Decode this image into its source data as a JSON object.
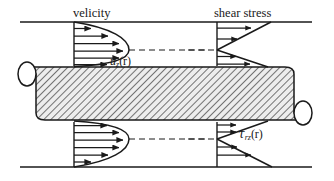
{
  "figure": {
    "type": "pipe-flow-profile-diagram",
    "title_labels": {
      "velocity": "velicity",
      "shear_stress": "shear stress"
    },
    "curve_labels": {
      "velocity_symbol": "u",
      "velocity_subscript": "z",
      "velocity_argument": "(r)",
      "shear_symbol": "τ",
      "shear_subscript": "rz",
      "shear_argument": "(r)"
    },
    "colors": {
      "line": "#1a1a1a",
      "hatch": "#555555",
      "pipe_fill": "#e8e8e8",
      "background": "#ffffff"
    },
    "geometry": {
      "top_wall_y": 22,
      "bottom_wall_y": 167,
      "pipe_top_y": 66,
      "pipe_bottom_y": 120,
      "velocity_axis_x": 74,
      "shear_axis_x": 217,
      "frame_left_x": 20,
      "frame_right_x": 312
    },
    "profiles": [
      {
        "name": "velocity-top",
        "kind": "parabolic",
        "position": "upper-half",
        "arrow_count": 6,
        "arrow_lengths": [
          18,
          36,
          48,
          52,
          48,
          36
        ],
        "max_at": "centerline",
        "zero_at": "wall"
      },
      {
        "name": "velocity-bottom",
        "kind": "parabolic",
        "position": "lower-half",
        "arrow_count": 6,
        "arrow_lengths": [
          36,
          48,
          52,
          48,
          36,
          18
        ],
        "max_at": "centerline",
        "zero_at": "wall"
      },
      {
        "name": "shear-top",
        "kind": "linear",
        "position": "upper-half",
        "arrow_count": 4,
        "arrow_lengths": [
          36,
          24,
          12,
          28
        ],
        "max_at": "wall",
        "zero_at": "centerline"
      },
      {
        "name": "shear-bottom",
        "kind": "linear",
        "position": "lower-half",
        "arrow_count": 4,
        "arrow_lengths": [
          12,
          24,
          36,
          36
        ],
        "max_at": "wall",
        "zero_at": "centerline"
      }
    ],
    "centerlines": [
      {
        "name": "velocity-centerline-top",
        "style": "dashed"
      },
      {
        "name": "shear-centerline-top",
        "style": "dashed"
      },
      {
        "name": "velocity-centerline-bottom",
        "style": "dashed"
      },
      {
        "name": "shear-centerline-bottom",
        "style": "dashed"
      }
    ]
  }
}
